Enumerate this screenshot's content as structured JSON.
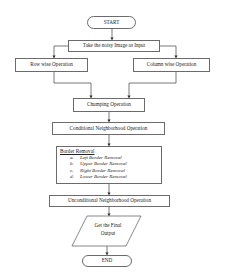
{
  "flowchart": {
    "start": "START",
    "input": "Take the noisy Image as Input",
    "row_op": "Row wise Operation",
    "col_op": "Column wise Operation",
    "chumping": "Chumping Operation",
    "conditional": "Conditional Neighborhood Operation",
    "border_removal": {
      "title": "Border Removal",
      "items": [
        {
          "letter": "a.",
          "label": "Left Border Removal"
        },
        {
          "letter": "b.",
          "label": "Upper Border Removal"
        },
        {
          "letter": "c.",
          "label": "Right Border Removal"
        },
        {
          "letter": "d.",
          "label": "Lower Border Removal"
        }
      ]
    },
    "unconditional": "Unconditional Neighborhood Operation",
    "output_line1": "Get the Final",
    "output_line2": "Output",
    "end": "END"
  },
  "colors": {
    "stroke": "#6b6b6b",
    "arrow": "#333333",
    "background": "#ffffff"
  }
}
